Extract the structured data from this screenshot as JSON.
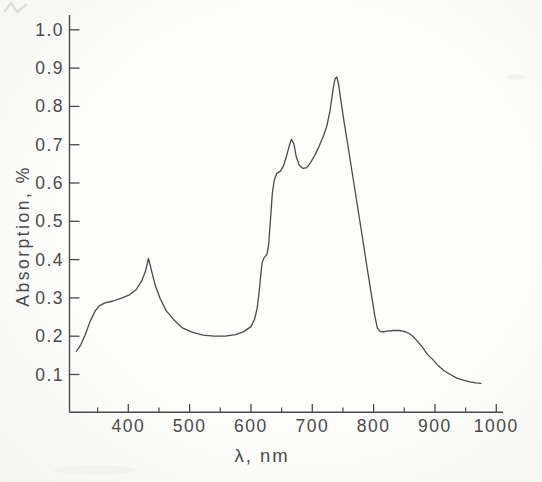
{
  "figure": {
    "kind": "scanned absorption spectrum line chart",
    "paper_color": "#fbfbfa",
    "ink_color": "#4a4a4a"
  },
  "chart_data": {
    "type": "line",
    "title": "",
    "xlabel": "λ, nm",
    "ylabel": "Absorption, %",
    "xlim": [
      305,
      1010
    ],
    "ylim": [
      0,
      1.05
    ],
    "grid": false,
    "legend": false,
    "x_ticks": [
      400,
      500,
      600,
      700,
      800,
      900,
      1000
    ],
    "x_tick_labels": [
      "400",
      "500",
      "600",
      "700",
      "800",
      "900",
      "1000"
    ],
    "x_minor_ticks": [
      350,
      450,
      550,
      650,
      750,
      850,
      950
    ],
    "y_ticks": [
      1.0,
      0.9,
      0.8,
      0.7,
      0.6,
      0.5,
      0.4,
      0.3,
      0.2,
      0.1
    ],
    "y_tick_labels": [
      "1.0",
      "0.9",
      "0.8",
      "0.7",
      "0.6",
      "0.5",
      "0.4",
      "0.3",
      "0.2",
      "0.1"
    ],
    "series": [
      {
        "name": "absorption spectrum",
        "points": [
          [
            315,
            0.16
          ],
          [
            322,
            0.176
          ],
          [
            330,
            0.205
          ],
          [
            338,
            0.24
          ],
          [
            346,
            0.266
          ],
          [
            353,
            0.28
          ],
          [
            362,
            0.287
          ],
          [
            375,
            0.292
          ],
          [
            390,
            0.3
          ],
          [
            402,
            0.308
          ],
          [
            413,
            0.322
          ],
          [
            422,
            0.345
          ],
          [
            428,
            0.37
          ],
          [
            433,
            0.403
          ],
          [
            438,
            0.37
          ],
          [
            444,
            0.332
          ],
          [
            452,
            0.298
          ],
          [
            462,
            0.266
          ],
          [
            474,
            0.243
          ],
          [
            488,
            0.222
          ],
          [
            505,
            0.21
          ],
          [
            522,
            0.203
          ],
          [
            540,
            0.2
          ],
          [
            558,
            0.2
          ],
          [
            575,
            0.204
          ],
          [
            588,
            0.212
          ],
          [
            600,
            0.225
          ],
          [
            606,
            0.245
          ],
          [
            610,
            0.272
          ],
          [
            613,
            0.31
          ],
          [
            616,
            0.36
          ],
          [
            618,
            0.39
          ],
          [
            621,
            0.404
          ],
          [
            626,
            0.413
          ],
          [
            629,
            0.44
          ],
          [
            632,
            0.51
          ],
          [
            635,
            0.575
          ],
          [
            638,
            0.608
          ],
          [
            642,
            0.625
          ],
          [
            648,
            0.631
          ],
          [
            653,
            0.645
          ],
          [
            658,
            0.67
          ],
          [
            663,
            0.7
          ],
          [
            666,
            0.714
          ],
          [
            670,
            0.702
          ],
          [
            674,
            0.668
          ],
          [
            679,
            0.646
          ],
          [
            685,
            0.638
          ],
          [
            691,
            0.64
          ],
          [
            697,
            0.653
          ],
          [
            704,
            0.672
          ],
          [
            711,
            0.695
          ],
          [
            718,
            0.722
          ],
          [
            724,
            0.75
          ],
          [
            729,
            0.79
          ],
          [
            734,
            0.845
          ],
          [
            737,
            0.872
          ],
          [
            740,
            0.877
          ],
          [
            743,
            0.856
          ],
          [
            747,
            0.812
          ],
          [
            752,
            0.757
          ],
          [
            758,
            0.698
          ],
          [
            766,
            0.617
          ],
          [
            774,
            0.536
          ],
          [
            782,
            0.455
          ],
          [
            790,
            0.372
          ],
          [
            797,
            0.302
          ],
          [
            802,
            0.253
          ],
          [
            806,
            0.222
          ],
          [
            810,
            0.213
          ],
          [
            815,
            0.211
          ],
          [
            822,
            0.213
          ],
          [
            832,
            0.215
          ],
          [
            842,
            0.215
          ],
          [
            851,
            0.212
          ],
          [
            858,
            0.207
          ],
          [
            865,
            0.198
          ],
          [
            872,
            0.186
          ],
          [
            880,
            0.17
          ],
          [
            888,
            0.152
          ],
          [
            897,
            0.138
          ],
          [
            906,
            0.122
          ],
          [
            915,
            0.11
          ],
          [
            925,
            0.1
          ],
          [
            935,
            0.091
          ],
          [
            946,
            0.085
          ],
          [
            957,
            0.081
          ],
          [
            967,
            0.078
          ],
          [
            975,
            0.077
          ]
        ]
      }
    ]
  }
}
